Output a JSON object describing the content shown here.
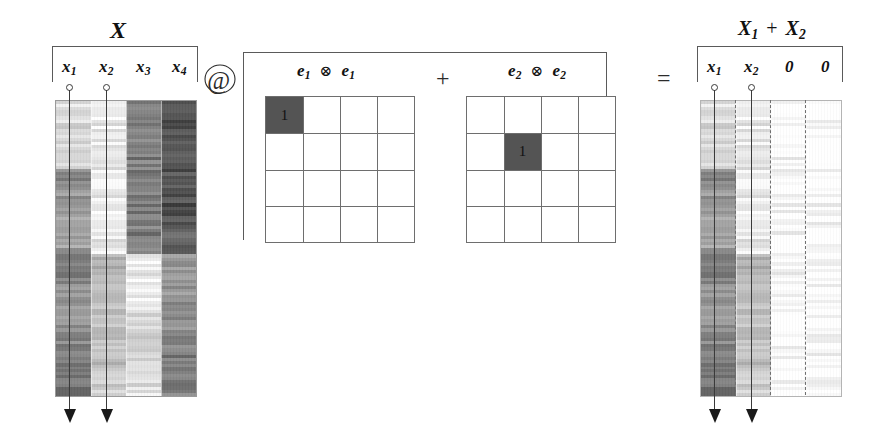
{
  "figure": {
    "title_left": "X",
    "title_right_parts": {
      "x1": "X",
      "sub1": "1",
      "plus": "+",
      "x2": "X",
      "sub2": "2"
    },
    "operators": {
      "matmul": "@",
      "plus": "+",
      "equals": "=",
      "kron": "⊗"
    }
  },
  "left_matrix": {
    "name": "X",
    "label": "X",
    "columns": [
      {
        "label": "x",
        "sub": "1",
        "marked": true
      },
      {
        "label": "x",
        "sub": "2",
        "marked": true
      },
      {
        "label": "x",
        "sub": "3",
        "marked": false
      },
      {
        "label": "x",
        "sub": "4",
        "marked": false
      }
    ]
  },
  "tensor_terms": [
    {
      "label_a": "e",
      "sub_a": "1",
      "kron": "⊗",
      "label_b": "e",
      "sub_b": "1",
      "rows": 4,
      "cols": 4,
      "filled_cell": {
        "row": 1,
        "col": 1,
        "value": "1"
      }
    },
    {
      "label_a": "e",
      "sub_a": "2",
      "kron": "⊗",
      "label_b": "e",
      "sub_b": "2",
      "rows": 4,
      "cols": 4,
      "filled_cell": {
        "row": 2,
        "col": 2,
        "value": "1"
      }
    }
  ],
  "right_matrix": {
    "name": "X1 + X2",
    "columns": [
      {
        "label": "x",
        "sub": "1",
        "marked": true,
        "zero": false
      },
      {
        "label": "x",
        "sub": "2",
        "marked": true,
        "zero": false
      },
      {
        "label": "0",
        "sub": "",
        "marked": false,
        "zero": true
      },
      {
        "label": "0",
        "sub": "",
        "marked": false,
        "zero": true
      }
    ]
  },
  "chart_data": {
    "type": "heatmap",
    "left_heatmap": {
      "columns": [
        "x1",
        "x2",
        "x3",
        "x4"
      ],
      "note": "greyscale column-block intensities, 0 = black, 1 = white",
      "column_blocks": [
        {
          "column": "x1",
          "blocks": [
            {
              "frac_start": 0.0,
              "frac_end": 0.23,
              "value": 0.86
            },
            {
              "frac_start": 0.23,
              "frac_end": 0.3,
              "value": 0.55
            },
            {
              "frac_start": 0.3,
              "frac_end": 0.52,
              "value": 0.6
            },
            {
              "frac_start": 0.52,
              "frac_end": 0.62,
              "value": 0.46
            },
            {
              "frac_start": 0.62,
              "frac_end": 0.76,
              "value": 0.58
            },
            {
              "frac_start": 0.76,
              "frac_end": 0.9,
              "value": 0.5
            },
            {
              "frac_start": 0.9,
              "frac_end": 1.0,
              "value": 0.44
            }
          ]
        },
        {
          "column": "x2",
          "blocks": [
            {
              "frac_start": 0.0,
              "frac_end": 0.52,
              "value": 0.93
            },
            {
              "frac_start": 0.52,
              "frac_end": 0.62,
              "value": 0.7
            },
            {
              "frac_start": 0.62,
              "frac_end": 1.0,
              "value": 0.78
            }
          ]
        },
        {
          "column": "x3",
          "blocks": [
            {
              "frac_start": 0.0,
              "frac_end": 0.52,
              "value": 0.5
            },
            {
              "frac_start": 0.52,
              "frac_end": 0.72,
              "value": 0.95
            },
            {
              "frac_start": 0.72,
              "frac_end": 0.84,
              "value": 0.8
            },
            {
              "frac_start": 0.84,
              "frac_end": 1.0,
              "value": 0.88
            }
          ]
        },
        {
          "column": "x4",
          "blocks": [
            {
              "frac_start": 0.0,
              "frac_end": 0.4,
              "value": 0.32
            },
            {
              "frac_start": 0.4,
              "frac_end": 0.52,
              "value": 0.38
            },
            {
              "frac_start": 0.52,
              "frac_end": 0.68,
              "value": 0.6
            },
            {
              "frac_start": 0.68,
              "frac_end": 0.86,
              "value": 0.55
            },
            {
              "frac_start": 0.86,
              "frac_end": 1.0,
              "value": 0.5
            }
          ]
        }
      ]
    },
    "right_heatmap": {
      "columns": [
        "x1",
        "x2",
        "0",
        "0"
      ],
      "note": "columns 1 and 2 copied from X; columns 3 and 4 are all zeros (white)",
      "column_blocks": [
        {
          "column": "x1",
          "blocks": [
            {
              "frac_start": 0.0,
              "frac_end": 0.23,
              "value": 0.86
            },
            {
              "frac_start": 0.23,
              "frac_end": 0.3,
              "value": 0.55
            },
            {
              "frac_start": 0.3,
              "frac_end": 0.52,
              "value": 0.6
            },
            {
              "frac_start": 0.52,
              "frac_end": 0.62,
              "value": 0.46
            },
            {
              "frac_start": 0.62,
              "frac_end": 0.76,
              "value": 0.58
            },
            {
              "frac_start": 0.76,
              "frac_end": 0.9,
              "value": 0.5
            },
            {
              "frac_start": 0.9,
              "frac_end": 1.0,
              "value": 0.44
            }
          ]
        },
        {
          "column": "x2",
          "blocks": [
            {
              "frac_start": 0.0,
              "frac_end": 0.52,
              "value": 0.93
            },
            {
              "frac_start": 0.52,
              "frac_end": 0.62,
              "value": 0.7
            },
            {
              "frac_start": 0.62,
              "frac_end": 1.0,
              "value": 0.78
            }
          ]
        },
        {
          "column": "0",
          "blocks": [
            {
              "frac_start": 0.0,
              "frac_end": 1.0,
              "value": 1.0
            }
          ]
        },
        {
          "column": "0",
          "blocks": [
            {
              "frac_start": 0.0,
              "frac_end": 1.0,
              "value": 1.0
            }
          ]
        }
      ]
    },
    "selector_matrices": [
      {
        "name": "e1⊗e1",
        "rows": 4,
        "cols": 4,
        "nonzero": [
          {
            "row": 1,
            "col": 1,
            "value": 1
          }
        ]
      },
      {
        "name": "e2⊗e2",
        "rows": 4,
        "cols": 4,
        "nonzero": [
          {
            "row": 2,
            "col": 2,
            "value": 1
          }
        ]
      }
    ]
  }
}
